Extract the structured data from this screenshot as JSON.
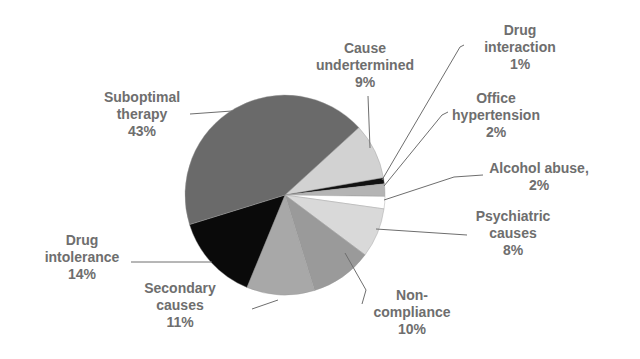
{
  "chart_data": {
    "type": "pie",
    "title": "",
    "start_angle_deg": 47.6,
    "direction": "clockwise",
    "center": [
      285,
      195
    ],
    "radius": 100,
    "slices": [
      {
        "label": "Cause undertermined",
        "value": 9,
        "color": "#d2d2d2"
      },
      {
        "label": "Drug interaction",
        "value": 1,
        "color": "#111111"
      },
      {
        "label": "Office hypertension",
        "value": 2,
        "color": "#b4b4b4"
      },
      {
        "label": "Alcohol abuse,",
        "value": 2,
        "color": "#ffffff"
      },
      {
        "label": "Psychiatric causes",
        "value": 8,
        "color": "#d9d9d9"
      },
      {
        "label": "Non-compliance",
        "value": 10,
        "color": "#9a9a9a"
      },
      {
        "label": "Secondary causes",
        "value": 11,
        "color": "#a8a8a8"
      },
      {
        "label": "Drug intolerance",
        "value": 14,
        "color": "#0a0a0a"
      },
      {
        "label": "Suboptimal therapy",
        "value": 43,
        "color": "#6a6a6a"
      }
    ]
  },
  "labels": [
    {
      "id": "cause",
      "lines": [
        "Cause",
        "undertermined",
        "9%"
      ],
      "x": 365,
      "y": 40
    },
    {
      "id": "druginteraction",
      "lines": [
        "Drug",
        "interaction",
        "1%"
      ],
      "x": 520,
      "y": 22
    },
    {
      "id": "office",
      "lines": [
        "Office",
        "hypertension",
        "2%"
      ],
      "x": 496,
      "y": 90
    },
    {
      "id": "alcohol",
      "lines": [
        "Alcohol abuse,",
        "2%"
      ],
      "x": 539,
      "y": 160
    },
    {
      "id": "psychiatric",
      "lines": [
        "Psychiatric",
        "causes",
        "8%"
      ],
      "x": 513,
      "y": 208
    },
    {
      "id": "noncompliance",
      "lines": [
        "Non-",
        "compliance",
        "10%"
      ],
      "x": 412,
      "y": 287
    },
    {
      "id": "secondary",
      "lines": [
        "Secondary",
        "causes",
        "11%"
      ],
      "x": 180,
      "y": 280
    },
    {
      "id": "drugintolerance",
      "lines": [
        "Drug",
        "intolerance",
        "14%"
      ],
      "x": 82,
      "y": 232
    },
    {
      "id": "suboptimal",
      "lines": [
        "Suboptimal",
        "therapy",
        "43%"
      ],
      "x": 142,
      "y": 89
    }
  ],
  "leaders": [
    {
      "id": "cause",
      "points": [
        [
          368,
          96
        ],
        [
          370,
          148
        ]
      ]
    },
    {
      "id": "druginteraction",
      "points": [
        [
          464,
          45
        ],
        [
          460,
          47
        ],
        [
          382,
          180
        ]
      ]
    },
    {
      "id": "office",
      "points": [
        [
          448,
          112
        ],
        [
          442,
          115
        ],
        [
          384,
          186
        ]
      ]
    },
    {
      "id": "alcohol",
      "points": [
        [
          483,
          175
        ],
        [
          454,
          177
        ],
        [
          384,
          200
        ]
      ]
    },
    {
      "id": "psychiatric",
      "points": [
        [
          467,
          235
        ],
        [
          376,
          229
        ]
      ]
    },
    {
      "id": "noncompliance",
      "points": [
        [
          345,
          253
        ],
        [
          366,
          290
        ],
        [
          362,
          304
        ]
      ]
    },
    {
      "id": "secondary",
      "points": [
        [
          252,
          309
        ],
        [
          278,
          300
        ]
      ]
    },
    {
      "id": "drugintolerance",
      "points": [
        [
          131,
          262
        ],
        [
          212,
          262
        ]
      ]
    },
    {
      "id": "suboptimal",
      "points": [
        [
          190,
          114
        ],
        [
          232,
          111
        ]
      ]
    }
  ]
}
